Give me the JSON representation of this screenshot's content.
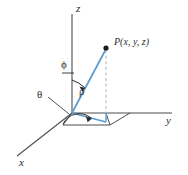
{
  "figure": {
    "colors": {
      "axis": "#4d4d4d",
      "vector": "#5a9bd0",
      "dashed": "#9fb8cc",
      "label": "#2b2b2b",
      "rho_label": "#4a3a28",
      "background": "#ffffff"
    },
    "axes": [
      {
        "name": "z-axis",
        "label": "z",
        "label_x": 76,
        "label_y": 4
      },
      {
        "name": "y-axis",
        "label": "y",
        "label_x": 167,
        "label_y": 118
      },
      {
        "name": "x-axis",
        "label": "x",
        "label_x": 20,
        "label_y": 159
      }
    ],
    "angles": [
      {
        "name": "phi",
        "label": "ϕ",
        "label_x": 61,
        "label_y": 60,
        "description": "polar angle from positive z-axis"
      },
      {
        "name": "theta",
        "label": "θ",
        "label_x": 38,
        "label_y": 90,
        "description": "azimuthal angle in xy-plane"
      }
    ],
    "segments": [
      {
        "name": "rho",
        "label": "ρ",
        "label_x": 79,
        "label_y": 88,
        "description": "radial distance from origin to P"
      }
    ],
    "points": [
      {
        "name": "point-P",
        "label": "P(x, y, z)",
        "label_x": 115,
        "label_y": 38,
        "marker_x": 106,
        "marker_y": 48
      }
    ],
    "origin": {
      "x": 72,
      "y": 113
    }
  }
}
